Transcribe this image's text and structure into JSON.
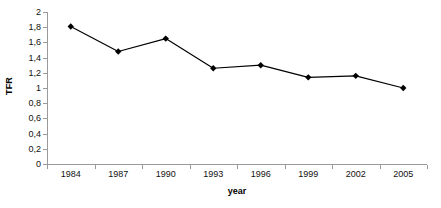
{
  "chart_data": {
    "type": "line",
    "title": "",
    "xlabel": "year",
    "ylabel": "TFR",
    "categories": [
      "1984",
      "1987",
      "1990",
      "1993",
      "1996",
      "1999",
      "2002",
      "2005"
    ],
    "values": [
      1.81,
      1.48,
      1.65,
      1.26,
      1.3,
      1.14,
      1.16,
      1.0
    ],
    "series": [
      {
        "name": "TFR",
        "values": [
          1.81,
          1.48,
          1.65,
          1.26,
          1.3,
          1.14,
          1.16,
          1.0
        ]
      }
    ],
    "ylim": [
      0,
      2
    ],
    "ytick_labels": [
      "0",
      "0,2",
      "0,4",
      "0,6",
      "0,8",
      "1",
      "1,2",
      "1,4",
      "1,6",
      "1,8",
      "2"
    ],
    "ytick_values": [
      0,
      0.2,
      0.4,
      0.6,
      0.8,
      1.0,
      1.2,
      1.4,
      1.6,
      1.8,
      2.0
    ],
    "grid": false,
    "legend": false,
    "legend_position": "none",
    "marker": "diamond",
    "decimal_separator": ",",
    "colors": {
      "line": "#000000",
      "marker": "#000000",
      "axis": "#9a9a9a",
      "text": "#111111",
      "background": "#ffffff"
    }
  }
}
